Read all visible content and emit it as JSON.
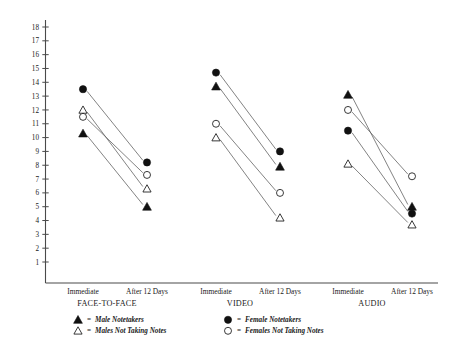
{
  "chart_data": {
    "type": "line",
    "title": "",
    "subtitle": "",
    "xlabel": "",
    "ylabel": "",
    "ylim": [
      0,
      18
    ],
    "yticks": [
      1,
      2,
      3,
      4,
      5,
      6,
      7,
      8,
      9,
      10,
      11,
      12,
      13,
      14,
      15,
      16,
      17,
      18
    ],
    "grid": false,
    "legend_position": "bottom",
    "x_tick_labels": [
      "Immediate",
      "After 12 Days",
      "Immediate",
      "After 12 Days",
      "Immediate",
      "After 12 Days"
    ],
    "groups": [
      "FACE-TO-FACE",
      "VIDEO",
      "AUDIO"
    ],
    "x_categories": [
      "Immediate",
      "After 12 Days"
    ],
    "legend": [
      {
        "marker": "filled-triangle",
        "label": "Male Notetakers"
      },
      {
        "marker": "open-triangle",
        "label": "Males Not Taking Notes"
      },
      {
        "marker": "filled-circle",
        "label": "Female Notetakers"
      },
      {
        "marker": "open-circle",
        "label": "Females Not Taking Notes"
      }
    ],
    "series": [
      {
        "name": "Male Notetakers",
        "marker": "filled-triangle",
        "values": {
          "FACE-TO-FACE": [
            10.3,
            5.0
          ],
          "VIDEO": [
            13.7,
            7.9
          ],
          "AUDIO": [
            13.1,
            5.0
          ]
        }
      },
      {
        "name": "Males Not Taking Notes",
        "marker": "open-triangle",
        "values": {
          "FACE-TO-FACE": [
            12.0,
            6.3
          ],
          "VIDEO": [
            10.0,
            4.2
          ],
          "AUDIO": [
            8.1,
            3.7
          ]
        }
      },
      {
        "name": "Female Notetakers",
        "marker": "filled-circle",
        "values": {
          "FACE-TO-FACE": [
            13.5,
            8.2
          ],
          "VIDEO": [
            14.7,
            9.0
          ],
          "AUDIO": [
            10.5,
            4.5
          ]
        }
      },
      {
        "name": "Females Not Taking Notes",
        "marker": "open-circle",
        "values": {
          "FACE-TO-FACE": [
            11.5,
            7.3
          ],
          "VIDEO": [
            11.0,
            6.0
          ],
          "AUDIO": [
            12.0,
            7.2
          ]
        }
      }
    ]
  },
  "axis": {
    "y_max_label": "18",
    "y_min_label": "1"
  },
  "legend_symbols": {
    "equals": "="
  }
}
